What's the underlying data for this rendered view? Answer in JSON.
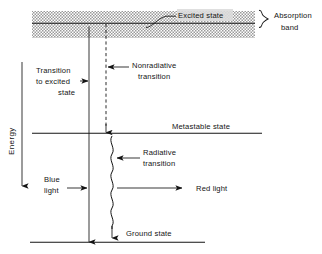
{
  "figure": {
    "title_visible": false,
    "axis": {
      "label": "Energy",
      "direction": "up"
    },
    "levels": [
      {
        "id": "excited",
        "label": "Excited state",
        "y": 23
      },
      {
        "id": "metastable",
        "label": "Metastable state",
        "y": 133
      },
      {
        "id": "ground",
        "label": "Ground state",
        "y": 242
      }
    ],
    "band": {
      "label_line1": "Absorption",
      "label_line2": "band",
      "top": 11,
      "bottom": 38
    },
    "annotations": [
      {
        "id": "transition-to-excited",
        "text_line1": "Transition",
        "text_line2": "to  excited",
        "text_line3": "state"
      },
      {
        "id": "nonradiative",
        "text_line1": "Nonradiative",
        "text_line2": "transition"
      },
      {
        "id": "radiative",
        "text_line1": "Radiative",
        "text_line2": "transition"
      },
      {
        "id": "blue-light",
        "text_line1": "Blue",
        "text_line2": "light"
      },
      {
        "id": "red-light",
        "text_line1": "Red light",
        "text_line2": ""
      }
    ],
    "colors": {
      "ink": "#141414",
      "band_fill": "#b3b3b3",
      "background": "#ffffff"
    }
  }
}
